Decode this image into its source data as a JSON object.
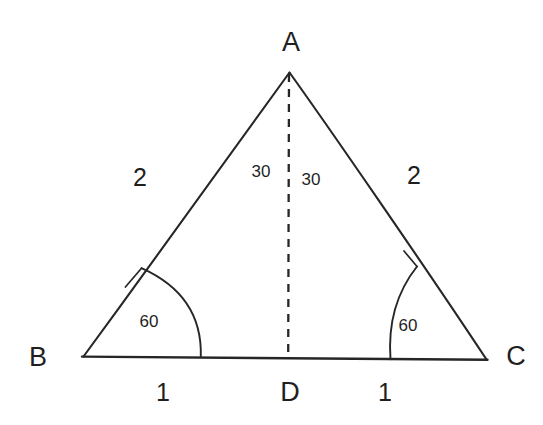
{
  "figure": {
    "type": "geometry-diagram",
    "shape": "equilateral-triangle-with-altitude",
    "background_color": "#ffffff",
    "stroke_color": "#262626",
    "text_color": "#1f1f1f"
  },
  "vertices": {
    "apex_label": "A",
    "left_label": "B",
    "right_label": "C",
    "foot_label": "D"
  },
  "side_lengths": {
    "left_side": "2",
    "right_side": "2",
    "base_left_half": "1",
    "base_right_half": "1"
  },
  "angles": {
    "apex_left": "30",
    "apex_right": "30",
    "base_left": "60",
    "base_right": "60"
  },
  "geometry": {
    "A": {
      "x": 289,
      "y": 71
    },
    "B": {
      "x": 82,
      "y": 357
    },
    "C": {
      "x": 487,
      "y": 360
    },
    "D": {
      "x": 288,
      "y": 358
    },
    "arc_radius_B": 119,
    "arc_radius_C": 97
  },
  "label_positions": {
    "A": {
      "x": 291,
      "y": 42
    },
    "B": {
      "x": 38,
      "y": 357
    },
    "C": {
      "x": 516,
      "y": 356
    },
    "D": {
      "x": 290,
      "y": 392
    },
    "left_side": {
      "x": 140,
      "y": 177
    },
    "right_side": {
      "x": 414,
      "y": 175
    },
    "apex_left_angle": {
      "x": 261,
      "y": 172
    },
    "apex_right_angle": {
      "x": 311,
      "y": 180
    },
    "base_left_angle": {
      "x": 149,
      "y": 322
    },
    "base_right_angle": {
      "x": 408,
      "y": 326
    },
    "base_left_len": {
      "x": 163,
      "y": 392
    },
    "base_right_len": {
      "x": 385,
      "y": 392
    }
  }
}
